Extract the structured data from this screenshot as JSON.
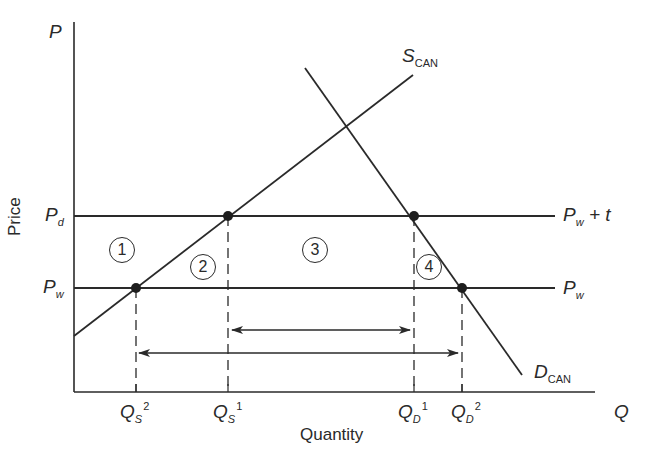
{
  "diagram": {
    "axes": {
      "y_axis_label": "P",
      "y_axis_title": "Price",
      "x_axis_label": "Q",
      "x_axis_title": "Quantity"
    },
    "price_levels": {
      "pd_main": "P",
      "pd_sub": "d",
      "pw_main": "P",
      "pw_sub": "w",
      "right_pw_t_main": "P",
      "right_pw_t_sub": "w",
      "right_pw_t_rest": " + t",
      "right_pw_main": "P",
      "right_pw_sub": "w"
    },
    "curves": {
      "supply_main": "S",
      "supply_sub": "CAN",
      "demand_main": "D",
      "demand_sub": "CAN"
    },
    "quantity_ticks": [
      {
        "main": "Q",
        "sub": "S",
        "sup": "2"
      },
      {
        "main": "Q",
        "sub": "S",
        "sup": "1"
      },
      {
        "main": "Q",
        "sub": "D",
        "sup": "1"
      },
      {
        "main": "Q",
        "sub": "D",
        "sup": "2"
      }
    ],
    "regions": [
      "1",
      "2",
      "3",
      "4"
    ],
    "colors": {
      "ink": "#2a2a2a",
      "background": "#ffffff"
    }
  }
}
